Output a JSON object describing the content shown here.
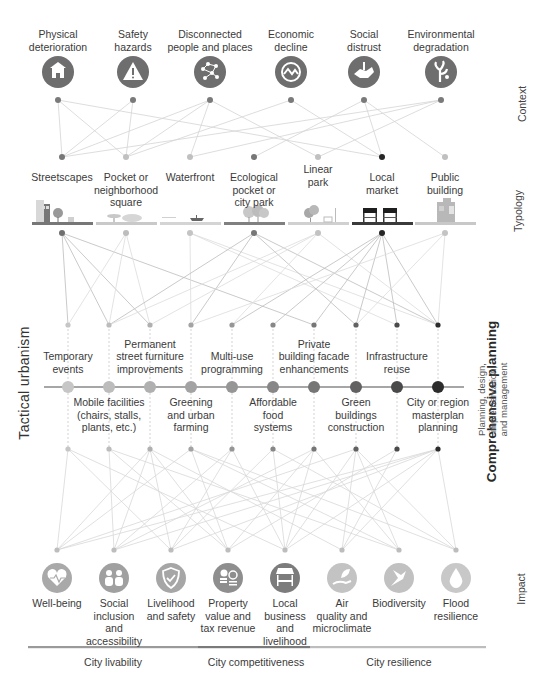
{
  "layers": {
    "context": "Context",
    "typology": "Typology",
    "tactical": "Tactical urbanism",
    "comprehensive": "Comprehensive planning",
    "comprehensive_sub": "Planning, design, implementation,\nand management",
    "impact": "Impact"
  },
  "context": [
    {
      "label": "Physical\ndeterioration",
      "icon": "house-damage-icon",
      "x": 58,
      "color": "#6e6e6e"
    },
    {
      "label": "Safety\nhazards",
      "icon": "warning-triangle-icon",
      "x": 133,
      "color": "#6e6e6e"
    },
    {
      "label": "Disconnected\npeople and places",
      "icon": "network-nodes-icon",
      "x": 210,
      "color": "#6e6e6e"
    },
    {
      "label": "Economic\ndecline",
      "icon": "economic-wave-icon",
      "x": 291,
      "color": "#6e6e6e"
    },
    {
      "label": "Social\ndistrust",
      "icon": "handshake-icon",
      "x": 364,
      "color": "#6e6e6e"
    },
    {
      "label": "Environmental\ndegradation",
      "icon": "dead-tree-icon",
      "x": 441,
      "color": "#6e6e6e"
    }
  ],
  "typology": [
    {
      "label": "Streetscapes",
      "x": 62,
      "dot": "#6f6f6f",
      "ground": "#777777",
      "icon": "streetscape-illustration"
    },
    {
      "label": "Pocket or\nneighborhood\nsquare",
      "x": 126,
      "dot": "#bdbdbd",
      "ground": "#c9c9c9",
      "icon": "square-illustration"
    },
    {
      "label": "Waterfront",
      "x": 190,
      "dot": "#c4c4c4",
      "ground": "#d4d4d4",
      "icon": "waterfront-illustration"
    },
    {
      "label": "Ecological\npocket or\ncity park",
      "x": 254,
      "dot": "#777777",
      "ground": "#808080",
      "icon": "ecological-park-illustration"
    },
    {
      "label": "Linear\npark",
      "x": 318,
      "dot": "#c2c2c2",
      "ground": "#d0d0d0",
      "icon": "linear-park-illustration"
    },
    {
      "label": "Local\nmarket",
      "x": 382,
      "dot": "#262626",
      "ground": "#3a3a3a",
      "icon": "market-stalls-illustration"
    },
    {
      "label": "Public\nbuilding",
      "x": 445,
      "dot": "#c4c4c4",
      "ground": "#c8c8c8",
      "icon": "public-building-illustration"
    }
  ],
  "tactical": [
    {
      "label": "Temporary\nevents",
      "pos": "above",
      "x": 68,
      "color": "#c6c6c6"
    },
    {
      "label": "Mobile facilities\n(chairs, stalls,\nplants, etc.)",
      "pos": "below",
      "x": 109,
      "color": "#bcbcbc"
    },
    {
      "label": "Permanent\nstreet furniture\nimprovements",
      "pos": "above",
      "x": 150,
      "color": "#b0b0b0"
    },
    {
      "label": "Greening\nand urban\nfarming",
      "pos": "below",
      "x": 191,
      "color": "#a3a3a3"
    },
    {
      "label": "Multi-use\nprogramming",
      "pos": "above",
      "x": 232,
      "color": "#969696"
    },
    {
      "label": "Affordable\nfood\nsystems",
      "pos": "below",
      "x": 273,
      "color": "#878787"
    },
    {
      "label": "Private\nbuilding facade\nenhancements",
      "pos": "above",
      "x": 314,
      "color": "#767676"
    },
    {
      "label": "Green\nbuildings\nconstruction",
      "pos": "below",
      "x": 356,
      "color": "#626262"
    },
    {
      "label": "Infrastructure\nreuse",
      "pos": "above",
      "x": 397,
      "color": "#4a4a4a"
    },
    {
      "label": "City or region\nmasterplan\nplanning",
      "pos": "below",
      "x": 438,
      "color": "#2c2c2c"
    }
  ],
  "impact": [
    {
      "label": "Well-being",
      "icon": "heart-pulse-icon",
      "x": 57,
      "color": "#a9a9a9"
    },
    {
      "label": "Social\ninclusion\nand\naccessibility",
      "icon": "people-group-icon",
      "x": 114,
      "color": "#a0a0a0"
    },
    {
      "label": "Livelihood\nand safety",
      "icon": "shield-check-icon",
      "x": 171,
      "color": "#a6a6a6"
    },
    {
      "label": "Property\nvalue and\ntax revenue",
      "icon": "coins-chart-icon",
      "x": 228,
      "color": "#8e8e8e"
    },
    {
      "label": "Local\nbusiness\nand\nlivelihood",
      "icon": "storefront-icon",
      "x": 285,
      "color": "#7c7c7c"
    },
    {
      "label": "Air\nquality and\nmicroclimate",
      "icon": "leaf-hand-icon",
      "x": 342,
      "color": "#c3c3c3"
    },
    {
      "label": "Biodiversity",
      "icon": "bird-icon",
      "x": 399,
      "color": "#c1c1c1"
    },
    {
      "label": "Flood\nresilience",
      "icon": "water-drop-icon",
      "x": 456,
      "color": "#c8c8c8"
    }
  ],
  "outcomes": [
    {
      "label": "City livability",
      "x": 113,
      "from": 28,
      "to": 198,
      "color": "#9a9a9a"
    },
    {
      "label": "City competitiveness",
      "x": 256,
      "from": 198,
      "to": 310,
      "color": "#7a7a7a"
    },
    {
      "label": "City resilience",
      "x": 399,
      "from": 310,
      "to": 486,
      "color": "#bdbdbd"
    }
  ],
  "edges": {
    "context_typology": [
      [
        0,
        0
      ],
      [
        0,
        1
      ],
      [
        0,
        5
      ],
      [
        1,
        0
      ],
      [
        1,
        1
      ],
      [
        2,
        0
      ],
      [
        2,
        1
      ],
      [
        2,
        2
      ],
      [
        2,
        4
      ],
      [
        3,
        1
      ],
      [
        3,
        5
      ],
      [
        4,
        3
      ],
      [
        4,
        5
      ],
      [
        4,
        6
      ],
      [
        5,
        0
      ],
      [
        5,
        2
      ],
      [
        5,
        4
      ]
    ],
    "typology_tactical": [
      [
        0,
        0
      ],
      [
        0,
        1
      ],
      [
        0,
        2
      ],
      [
        0,
        6
      ],
      [
        1,
        0
      ],
      [
        1,
        1
      ],
      [
        1,
        2
      ],
      [
        2,
        3
      ],
      [
        2,
        8
      ],
      [
        2,
        9
      ],
      [
        3,
        1
      ],
      [
        3,
        3
      ],
      [
        3,
        7
      ],
      [
        3,
        9
      ],
      [
        4,
        1
      ],
      [
        4,
        2
      ],
      [
        4,
        4
      ],
      [
        4,
        9
      ],
      [
        5,
        4
      ],
      [
        5,
        5
      ],
      [
        5,
        6
      ],
      [
        5,
        7
      ],
      [
        5,
        8
      ],
      [
        5,
        9
      ],
      [
        6,
        7
      ],
      [
        6,
        9
      ],
      [
        6,
        3
      ]
    ],
    "tactical_impact": [
      [
        0,
        0
      ],
      [
        0,
        2
      ],
      [
        0,
        4
      ],
      [
        1,
        1
      ],
      [
        1,
        3
      ],
      [
        1,
        6
      ],
      [
        2,
        0
      ],
      [
        2,
        1
      ],
      [
        2,
        2
      ],
      [
        2,
        3
      ],
      [
        2,
        5
      ],
      [
        3,
        0
      ],
      [
        3,
        3
      ],
      [
        3,
        6
      ],
      [
        3,
        7
      ],
      [
        4,
        1
      ],
      [
        4,
        2
      ],
      [
        4,
        4
      ],
      [
        5,
        2
      ],
      [
        5,
        4
      ],
      [
        5,
        7
      ],
      [
        6,
        1
      ],
      [
        6,
        3
      ],
      [
        6,
        4
      ],
      [
        6,
        6
      ],
      [
        7,
        0
      ],
      [
        7,
        4
      ],
      [
        7,
        5
      ],
      [
        7,
        6
      ],
      [
        7,
        7
      ],
      [
        8,
        3
      ],
      [
        8,
        5
      ],
      [
        9,
        0
      ],
      [
        9,
        1
      ],
      [
        9,
        2
      ],
      [
        9,
        4
      ],
      [
        9,
        5
      ],
      [
        9,
        7
      ]
    ]
  }
}
